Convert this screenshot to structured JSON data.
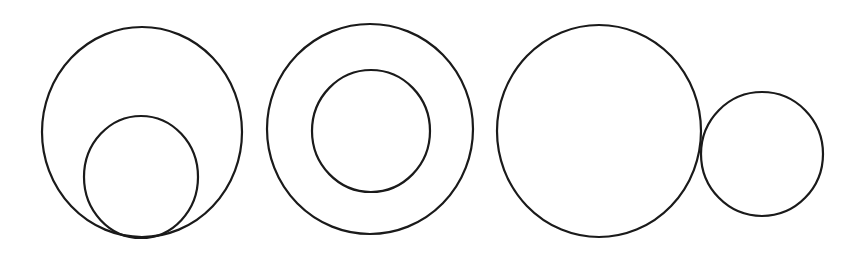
{
  "canvas": {
    "width": 866,
    "height": 255,
    "background": "#ffffff",
    "stroke": "#1a1a1a"
  },
  "figures": [
    {
      "label": "internally-tangent-circles",
      "circles": [
        {
          "role": "outer",
          "cx": 142,
          "cy": 132,
          "rx": 100,
          "ry": 105
        },
        {
          "role": "inner",
          "cx": 141,
          "cy": 177,
          "rx": 57,
          "ry": 61
        }
      ]
    },
    {
      "label": "concentric-circles",
      "circles": [
        {
          "role": "outer",
          "cx": 370,
          "cy": 129,
          "rx": 103,
          "ry": 105
        },
        {
          "role": "inner",
          "cx": 371,
          "cy": 131,
          "rx": 59,
          "ry": 61
        }
      ]
    },
    {
      "label": "externally-tangent-circles",
      "circles": [
        {
          "role": "large",
          "cx": 599,
          "cy": 131,
          "rx": 102,
          "ry": 106
        },
        {
          "role": "small",
          "cx": 762,
          "cy": 154,
          "rx": 61,
          "ry": 62
        }
      ]
    }
  ]
}
